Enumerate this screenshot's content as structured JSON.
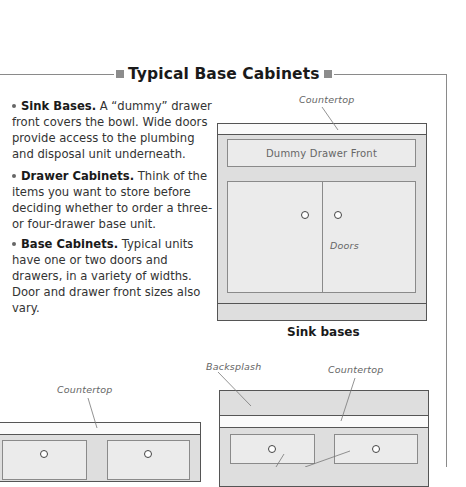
{
  "section": {
    "title": "Typical Base Cabinets"
  },
  "paragraphs": [
    {
      "heading": "Sink Bases.",
      "body": " A “dummy” drawer front covers the bowl. Wide doors provide access to the plumbing and disposal unit underneath."
    },
    {
      "heading": "Drawer Cabinets.",
      "body": " Think of the items you want to store before deciding whether to order a three- or four-drawer base unit."
    },
    {
      "heading": "Base Cabinets.",
      "body": " Typical units have one or two doors and drawers, in a variety of widths. Door and drawer front sizes also vary."
    }
  ],
  "diagrams": {
    "sink_base": {
      "countertop_label": "Countertop",
      "drawer_label": "Dummy Drawer Front",
      "doors_label": "Doors",
      "caption": "Sink bases"
    },
    "left_cabinet": {
      "countertop_label": "Countertop"
    },
    "right_cabinet": {
      "backsplash_label": "Backsplash",
      "countertop_label": "Countertop"
    }
  },
  "colors": {
    "frame": "#8a8a8a",
    "cabinet_fill": "#dedede",
    "panel_fill": "#ebebeb",
    "square_marker": "#8c8c8c"
  }
}
